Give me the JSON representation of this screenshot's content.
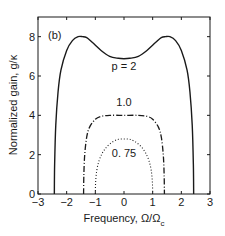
{
  "chart_data": {
    "type": "line",
    "panel_label": "(b)",
    "title": "",
    "xlabel": "Frequency, Ω/Ω",
    "xlabel_sub": "c",
    "ylabel": "Normalized gain, g/κ",
    "xlim": [
      -3,
      3
    ],
    "ylim": [
      0,
      9
    ],
    "xticks": [
      -3,
      -2,
      -1,
      0,
      1,
      2,
      3
    ],
    "xtick_labels": [
      "−3",
      "−2",
      "−1",
      "0",
      "1",
      "2",
      "3"
    ],
    "yticks": [
      0,
      2,
      4,
      6,
      8
    ],
    "ytick_labels": [
      "0",
      "2",
      "4",
      "6",
      "8"
    ],
    "grid": false,
    "legend": "none (inline annotations)",
    "series": [
      {
        "name": "p = 2",
        "label_text": "p = 2",
        "style": "solid",
        "color": "#1a1a1a",
        "x": [
          -2.43,
          -2.42,
          -2.38,
          -2.3,
          -2.2,
          -2.0,
          -1.8,
          -1.6,
          -1.45,
          -1.3,
          -1.1,
          -0.8,
          -0.5,
          -0.2,
          0.0,
          0.2,
          0.5,
          0.8,
          1.1,
          1.3,
          1.45,
          1.6,
          1.8,
          2.0,
          2.2,
          2.3,
          2.38,
          2.42,
          2.43
        ],
        "y": [
          0.0,
          1.5,
          3.5,
          5.2,
          6.3,
          7.3,
          7.8,
          8.0,
          8.0,
          7.95,
          7.7,
          7.3,
          7.0,
          6.9,
          6.88,
          6.9,
          7.0,
          7.3,
          7.7,
          7.95,
          8.0,
          8.0,
          7.8,
          7.3,
          6.3,
          5.2,
          3.5,
          1.5,
          0.0
        ],
        "label_pos": [
          0.0,
          6.3
        ]
      },
      {
        "name": "1.0",
        "label_text": "1.0",
        "style": "dashdot",
        "color": "#1a1a1a",
        "x": [
          -1.41,
          -1.4,
          -1.37,
          -1.3,
          -1.2,
          -1.0,
          -0.8,
          -0.5,
          0.0,
          0.5,
          0.8,
          1.0,
          1.2,
          1.3,
          1.37,
          1.4,
          1.41
        ],
        "y": [
          0.0,
          1.0,
          2.0,
          2.9,
          3.4,
          3.8,
          3.95,
          4.0,
          4.0,
          4.0,
          3.95,
          3.8,
          3.4,
          2.9,
          2.0,
          1.0,
          0.0
        ],
        "label_pos": [
          0.0,
          4.5
        ]
      },
      {
        "name": "0.75",
        "label_text": "0. 75",
        "style": "dotted",
        "color": "#1a1a1a",
        "x": [
          -1.0,
          -0.99,
          -0.95,
          -0.87,
          -0.75,
          -0.6,
          -0.4,
          -0.2,
          0.0,
          0.2,
          0.4,
          0.6,
          0.75,
          0.87,
          0.95,
          0.99,
          1.0
        ],
        "y": [
          0.0,
          0.6,
          1.2,
          1.7,
          2.1,
          2.4,
          2.65,
          2.78,
          2.8,
          2.78,
          2.65,
          2.4,
          2.1,
          1.7,
          1.2,
          0.6,
          0.0
        ],
        "label_pos": [
          0.0,
          1.9
        ]
      }
    ]
  }
}
